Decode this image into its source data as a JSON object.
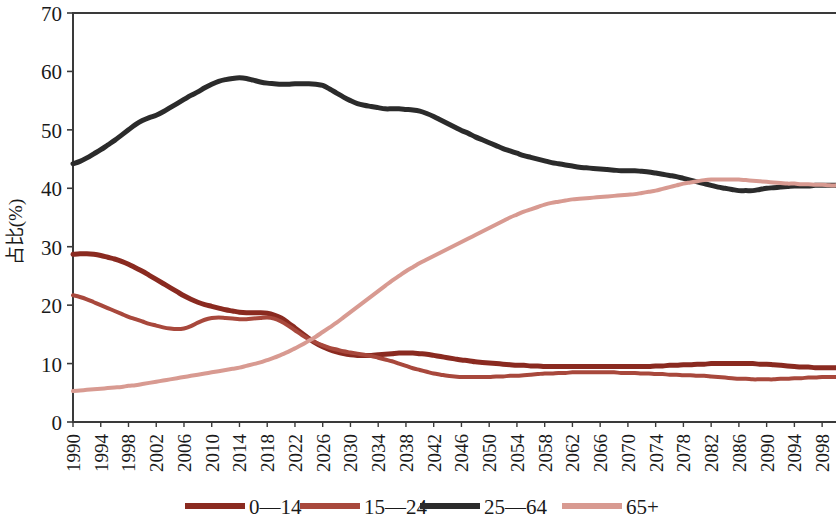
{
  "chart_data": {
    "type": "line",
    "title": "",
    "xlabel": "",
    "ylabel": "占比(%)",
    "ylim": [
      0,
      70
    ],
    "ytick_labels": [
      "0",
      "10",
      "20",
      "30",
      "40",
      "50",
      "60",
      "70"
    ],
    "ytick_values": [
      0,
      10,
      20,
      30,
      40,
      50,
      60,
      70
    ],
    "grid": false,
    "legend_position": "bottom",
    "x": [
      1990,
      1991,
      1992,
      1993,
      1994,
      1995,
      1996,
      1997,
      1998,
      1999,
      2000,
      2001,
      2002,
      2003,
      2004,
      2005,
      2006,
      2007,
      2008,
      2009,
      2010,
      2011,
      2012,
      2013,
      2014,
      2015,
      2016,
      2017,
      2018,
      2019,
      2020,
      2021,
      2022,
      2023,
      2024,
      2025,
      2026,
      2027,
      2028,
      2029,
      2030,
      2031,
      2032,
      2033,
      2034,
      2035,
      2036,
      2037,
      2038,
      2039,
      2040,
      2041,
      2042,
      2043,
      2044,
      2045,
      2046,
      2047,
      2048,
      2049,
      2050,
      2051,
      2052,
      2053,
      2054,
      2055,
      2056,
      2057,
      2058,
      2059,
      2060,
      2061,
      2062,
      2063,
      2064,
      2065,
      2066,
      2067,
      2068,
      2069,
      2070,
      2071,
      2072,
      2073,
      2074,
      2075,
      2076,
      2077,
      2078,
      2079,
      2080,
      2081,
      2082,
      2083,
      2084,
      2085,
      2086,
      2087,
      2088,
      2089,
      2090,
      2091,
      2092,
      2093,
      2094,
      2095,
      2096,
      2097,
      2098,
      2099,
      2100
    ],
    "xtick_labels": [
      "1990",
      "1994",
      "1998",
      "2002",
      "2006",
      "2010",
      "2014",
      "2018",
      "2022",
      "2026",
      "2030",
      "2034",
      "2038",
      "2042",
      "2046",
      "2050",
      "2054",
      "2058",
      "2062",
      "2066",
      "2070",
      "2074",
      "2078",
      "2082",
      "2086",
      "2090",
      "2094",
      "2098"
    ],
    "xtick_values": [
      1990,
      1994,
      1998,
      2002,
      2006,
      2010,
      2014,
      2018,
      2022,
      2026,
      2030,
      2034,
      2038,
      2042,
      2046,
      2050,
      2054,
      2058,
      2062,
      2066,
      2070,
      2074,
      2078,
      2082,
      2086,
      2090,
      2094,
      2098
    ],
    "series": [
      {
        "name": "0—14",
        "color": "#8a2a20",
        "width": 5,
        "values": [
          28.7,
          28.8,
          28.8,
          28.7,
          28.5,
          28.2,
          27.9,
          27.5,
          27.0,
          26.4,
          25.8,
          25.1,
          24.4,
          23.7,
          23.0,
          22.3,
          21.6,
          21.0,
          20.5,
          20.1,
          19.8,
          19.5,
          19.2,
          19.0,
          18.8,
          18.7,
          18.7,
          18.7,
          18.6,
          18.3,
          17.8,
          17.0,
          16.1,
          15.2,
          14.3,
          13.5,
          12.9,
          12.4,
          12.0,
          11.7,
          11.5,
          11.4,
          11.4,
          11.4,
          11.5,
          11.6,
          11.7,
          11.8,
          11.8,
          11.8,
          11.7,
          11.6,
          11.4,
          11.2,
          11.0,
          10.8,
          10.6,
          10.5,
          10.3,
          10.2,
          10.1,
          10.0,
          9.9,
          9.8,
          9.7,
          9.7,
          9.6,
          9.6,
          9.5,
          9.5,
          9.5,
          9.5,
          9.5,
          9.5,
          9.5,
          9.5,
          9.5,
          9.5,
          9.5,
          9.5,
          9.5,
          9.5,
          9.5,
          9.5,
          9.6,
          9.6,
          9.7,
          9.7,
          9.8,
          9.8,
          9.9,
          9.9,
          10.0,
          10.0,
          10.0,
          10.0,
          10.0,
          10.0,
          10.0,
          9.9,
          9.9,
          9.8,
          9.7,
          9.6,
          9.5,
          9.4,
          9.4,
          9.3,
          9.3,
          9.3,
          9.3
        ]
      },
      {
        "name": "15—24",
        "color": "#a8483c",
        "width": 4,
        "values": [
          21.7,
          21.4,
          21.0,
          20.5,
          20.0,
          19.5,
          19.0,
          18.5,
          18.0,
          17.6,
          17.2,
          16.8,
          16.5,
          16.2,
          16.0,
          15.9,
          16.0,
          16.4,
          17.0,
          17.5,
          17.8,
          17.9,
          17.8,
          17.7,
          17.6,
          17.6,
          17.7,
          17.8,
          17.9,
          17.7,
          17.2,
          16.5,
          15.7,
          14.9,
          14.2,
          13.6,
          13.1,
          12.7,
          12.4,
          12.1,
          11.9,
          11.7,
          11.5,
          11.3,
          11.0,
          10.7,
          10.4,
          10.0,
          9.6,
          9.2,
          8.9,
          8.6,
          8.3,
          8.1,
          7.9,
          7.8,
          7.7,
          7.7,
          7.7,
          7.7,
          7.7,
          7.8,
          7.8,
          7.9,
          7.9,
          8.0,
          8.1,
          8.2,
          8.3,
          8.3,
          8.4,
          8.4,
          8.5,
          8.5,
          8.5,
          8.5,
          8.5,
          8.5,
          8.5,
          8.4,
          8.4,
          8.4,
          8.3,
          8.3,
          8.2,
          8.2,
          8.1,
          8.1,
          8.0,
          8.0,
          7.9,
          7.9,
          7.8,
          7.7,
          7.6,
          7.5,
          7.4,
          7.4,
          7.3,
          7.3,
          7.3,
          7.3,
          7.4,
          7.4,
          7.5,
          7.5,
          7.6,
          7.6,
          7.7,
          7.7,
          7.7
        ]
      },
      {
        "name": "25—64",
        "color": "#2b2b2b",
        "width": 5,
        "values": [
          44.2,
          44.6,
          45.2,
          45.9,
          46.6,
          47.4,
          48.2,
          49.1,
          50.0,
          50.9,
          51.6,
          52.1,
          52.5,
          53.1,
          53.8,
          54.5,
          55.2,
          55.9,
          56.5,
          57.2,
          57.8,
          58.3,
          58.6,
          58.8,
          58.9,
          58.8,
          58.5,
          58.2,
          58.0,
          57.9,
          57.8,
          57.8,
          57.9,
          57.9,
          57.9,
          57.8,
          57.6,
          57.0,
          56.3,
          55.6,
          55.0,
          54.5,
          54.2,
          54.0,
          53.8,
          53.6,
          53.6,
          53.6,
          53.5,
          53.4,
          53.2,
          52.8,
          52.3,
          51.7,
          51.1,
          50.5,
          49.9,
          49.4,
          48.8,
          48.3,
          47.8,
          47.3,
          46.8,
          46.4,
          46.0,
          45.6,
          45.3,
          45.0,
          44.7,
          44.4,
          44.2,
          44.0,
          43.8,
          43.6,
          43.5,
          43.4,
          43.3,
          43.2,
          43.1,
          43.0,
          43.0,
          43.0,
          42.9,
          42.8,
          42.6,
          42.4,
          42.2,
          42.0,
          41.7,
          41.4,
          41.1,
          40.8,
          40.5,
          40.2,
          40.0,
          39.8,
          39.6,
          39.6,
          39.6,
          39.8,
          40.0,
          40.1,
          40.2,
          40.3,
          40.4,
          40.4,
          40.4,
          40.5,
          40.5,
          40.5,
          40.5
        ]
      },
      {
        "name": "65+",
        "color": "#d89a91",
        "width": 4,
        "values": [
          5.3,
          5.4,
          5.5,
          5.6,
          5.7,
          5.8,
          5.9,
          6.0,
          6.2,
          6.3,
          6.5,
          6.7,
          6.9,
          7.1,
          7.3,
          7.5,
          7.7,
          7.9,
          8.1,
          8.3,
          8.5,
          8.7,
          8.9,
          9.1,
          9.3,
          9.6,
          9.9,
          10.2,
          10.6,
          11.0,
          11.5,
          12.0,
          12.6,
          13.2,
          13.9,
          14.6,
          15.4,
          16.2,
          17.0,
          17.9,
          18.8,
          19.7,
          20.6,
          21.5,
          22.4,
          23.3,
          24.2,
          25.0,
          25.8,
          26.5,
          27.2,
          27.8,
          28.4,
          29.0,
          29.6,
          30.2,
          30.8,
          31.4,
          32.0,
          32.6,
          33.2,
          33.8,
          34.4,
          35.0,
          35.5,
          36.0,
          36.4,
          36.8,
          37.2,
          37.5,
          37.7,
          37.9,
          38.1,
          38.2,
          38.3,
          38.4,
          38.5,
          38.6,
          38.7,
          38.8,
          38.9,
          39.0,
          39.2,
          39.4,
          39.6,
          39.9,
          40.2,
          40.5,
          40.8,
          41.0,
          41.2,
          41.4,
          41.5,
          41.5,
          41.5,
          41.5,
          41.5,
          41.4,
          41.3,
          41.2,
          41.1,
          41.0,
          40.9,
          40.8,
          40.8,
          40.7,
          40.7,
          40.6,
          40.6,
          40.5,
          40.5
        ]
      }
    ]
  },
  "legend": {
    "items": [
      {
        "label": "0—14",
        "color": "#8a2a20"
      },
      {
        "label": "15—24",
        "color": "#a8483c"
      },
      {
        "label": "25—64",
        "color": "#2b2b2b"
      },
      {
        "label": "65+",
        "color": "#d89a91"
      }
    ]
  }
}
